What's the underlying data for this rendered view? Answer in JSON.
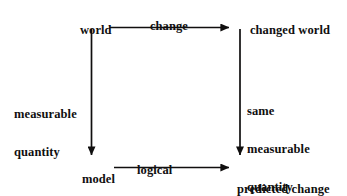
{
  "diagram": {
    "background_color": "#ffffff",
    "ink_color": "#100f0f",
    "nodes": [
      {
        "id": "world",
        "label": "world",
        "x": 67,
        "y": 11
      },
      {
        "id": "changed_world",
        "label": "changed world",
        "x": 237,
        "y": 11
      },
      {
        "id": "model",
        "label": "model",
        "x": 69,
        "y": 160
      },
      {
        "id": "predicted",
        "label": "predicted change\nin state",
        "x": 237,
        "y": 158
      }
    ],
    "edges": [
      {
        "id": "world_to_changed_world",
        "from": "world",
        "to": "changed_world",
        "label": "change",
        "direction": "right",
        "label_x": 137,
        "label_y": 7
      },
      {
        "id": "world_to_model",
        "from": "world",
        "to": "model",
        "label": "measurable\nquantity",
        "direction": "down",
        "label_x": 14,
        "label_y": 83
      },
      {
        "id": "changed_world_to_predicted",
        "from": "changed_world",
        "to": "predicted",
        "label": "same\nmeasurable\nquantity",
        "direction": "down",
        "label_x": 247,
        "label_y": 80
      },
      {
        "id": "model_to_predicted",
        "from": "model",
        "to": "predicted",
        "label": "logical\nentailment",
        "direction": "right",
        "label_x": 137,
        "label_y": 139
      }
    ],
    "node_labels": {
      "world": "world",
      "changed_world": "changed world",
      "model": "model",
      "predicted_line1": "predicted change",
      "predicted_line2": "in state"
    },
    "edge_labels": {
      "change": "change",
      "measurable_line1": "measurable",
      "measurable_line2": "quantity",
      "same_line1": "same",
      "same_line2": "measurable",
      "same_line3": "quantity",
      "logical_line1": "logical",
      "logical_line2": "entailment"
    }
  }
}
